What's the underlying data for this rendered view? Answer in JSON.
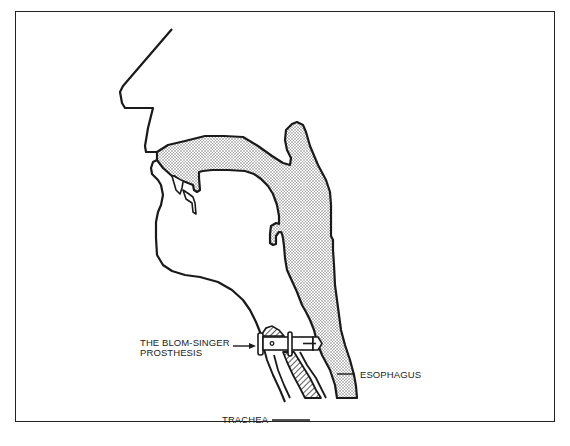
{
  "figure": {
    "labels": {
      "prosthesis_line1": "THE BLOM-SINGER",
      "prosthesis_line2": "PROSTHESIS",
      "esophagus": "ESOPHAGUS",
      "trachea": "TRACHEA"
    },
    "colors": {
      "outline": "#1a1a1a",
      "stipple": "#9a9a9a",
      "background": "#ffffff"
    }
  }
}
